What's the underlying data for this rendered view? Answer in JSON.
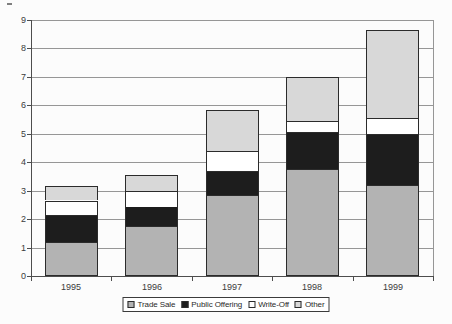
{
  "chart_data": {
    "type": "bar",
    "stacked": true,
    "title": "",
    "xlabel": "",
    "ylabel": "",
    "categories": [
      "1995",
      "1996",
      "1997",
      "1998",
      "1999"
    ],
    "series": [
      {
        "name": "Trade Sale",
        "color": "#b3b3b3",
        "values": [
          1.2,
          1.75,
          2.85,
          3.75,
          3.2
        ]
      },
      {
        "name": "Public Offering",
        "color": "#1d1d1d",
        "values": [
          0.95,
          0.7,
          0.85,
          1.3,
          1.8
        ]
      },
      {
        "name": "Write-Off",
        "color": "#ffffff",
        "values": [
          0.5,
          0.55,
          0.7,
          0.4,
          0.55
        ]
      },
      {
        "name": "Other",
        "color": "#d8d8d8",
        "values": [
          0.5,
          0.55,
          1.45,
          1.55,
          3.1
        ]
      }
    ],
    "ylim": [
      0,
      9
    ],
    "yticks": [
      0,
      1,
      2,
      3,
      4,
      5,
      6,
      7,
      8,
      9
    ],
    "grid": true,
    "legend_position": "bottom"
  },
  "colors": {
    "background": "#fcfcfc",
    "gridline": "#969696",
    "axis": "#4d4d4d",
    "bar_border": "#2b2b2b",
    "text": "#3b3b3b",
    "legend_border": "#3b3b3b",
    "legend_background": "#ffffff"
  }
}
